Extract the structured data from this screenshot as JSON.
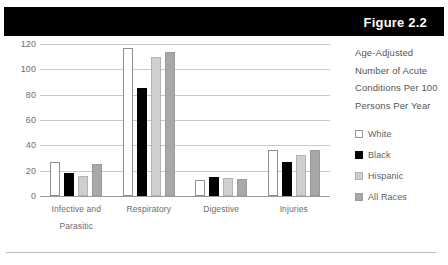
{
  "figure": {
    "title": "Figure 2.2",
    "subtitle_lines": [
      "Age-Adjusted",
      "Number of Acute",
      "Conditions Per 100",
      "Persons Per Year"
    ]
  },
  "colors": {
    "banner_background": "#000000",
    "banner_text": "#ffffff",
    "white_series": "#ffffff",
    "black_series": "#000000",
    "hispanic_series": "#cfcfcf",
    "all_races_series": "#a8a8a8",
    "gridline": "#c9c9c9",
    "text": "#5f5f5f"
  },
  "chart_data": {
    "type": "bar",
    "title": "Figure 2.2",
    "subtitle": "Age-Adjusted Number of Acute Conditions Per 100 Persons Per Year",
    "xlabel": "",
    "ylabel": "",
    "ylim": [
      0,
      120
    ],
    "yticks": [
      0,
      20,
      40,
      60,
      80,
      100,
      120
    ],
    "grid": true,
    "legend_position": "right",
    "categories": [
      "Infective and Parasitic",
      "Respiratory",
      "Digestive",
      "Injuries"
    ],
    "category_label_lines": [
      [
        "Infective and",
        "Parasitic"
      ],
      [
        "Respiratory",
        ""
      ],
      [
        "Digestive",
        ""
      ],
      [
        "Injuries",
        ""
      ]
    ],
    "series": [
      {
        "name": "White",
        "values": [
          27,
          117,
          12.5,
          36
        ]
      },
      {
        "name": "Black",
        "values": [
          18.5,
          85,
          15,
          27
        ]
      },
      {
        "name": "Hispanic",
        "values": [
          16,
          110,
          14,
          32.5
        ]
      },
      {
        "name": "All Races",
        "values": [
          25.5,
          114,
          13.5,
          36
        ]
      }
    ]
  },
  "legend": {
    "items": [
      {
        "label": "White",
        "style": "s-white"
      },
      {
        "label": "Black",
        "style": "s-black"
      },
      {
        "label": "Hispanic",
        "style": "s-hisp"
      },
      {
        "label": "All Races",
        "style": "s-all"
      }
    ]
  }
}
